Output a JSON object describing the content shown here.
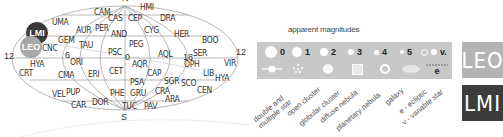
{
  "sky_chart": {
    "pole_label_north": "N",
    "pole_label_south": "S",
    "ra_labels": [
      {
        "text": "12",
        "x": 4,
        "y": 60
      },
      {
        "text": "6",
        "x": 57,
        "y": 56
      },
      {
        "text": "0",
        "x": 123,
        "y": 56
      },
      {
        "text": "18",
        "x": 184,
        "y": 56
      },
      {
        "text": "12",
        "x": 237,
        "y": 52
      }
    ],
    "highlight": {
      "lmi": {
        "label": "LMI",
        "color": "#3a3a3a"
      },
      "leo": {
        "label": "LEO",
        "color": "#a8a8a8"
      }
    },
    "constellations": [
      {
        "abbr": "CAM",
        "x": 94,
        "y": 8
      },
      {
        "abbr": "HMI",
        "x": 140,
        "y": 3
      },
      {
        "abbr": "UMA",
        "x": 52,
        "y": 18
      },
      {
        "abbr": "CAS",
        "x": 108,
        "y": 14
      },
      {
        "abbr": "CEP",
        "x": 128,
        "y": 14
      },
      {
        "abbr": "DRA",
        "x": 160,
        "y": 14
      },
      {
        "abbr": "AUR",
        "x": 76,
        "y": 26
      },
      {
        "abbr": "PER",
        "x": 95,
        "y": 24
      },
      {
        "abbr": "CYG",
        "x": 144,
        "y": 26
      },
      {
        "abbr": "AND",
        "x": 111,
        "y": 30
      },
      {
        "abbr": "HER",
        "x": 174,
        "y": 30
      },
      {
        "abbr": "BOO",
        "x": 202,
        "y": 36
      },
      {
        "abbr": "GEM",
        "x": 58,
        "y": 36
      },
      {
        "abbr": "TAU",
        "x": 79,
        "y": 41
      },
      {
        "abbr": "PEG",
        "x": 129,
        "y": 40
      },
      {
        "abbr": "CNC",
        "x": 42,
        "y": 44
      },
      {
        "abbr": "PSC",
        "x": 108,
        "y": 48
      },
      {
        "abbr": "AQL",
        "x": 158,
        "y": 50
      },
      {
        "abbr": "SER",
        "x": 193,
        "y": 49
      },
      {
        "abbr": "ORI",
        "x": 70,
        "y": 58
      },
      {
        "abbr": "AQR",
        "x": 132,
        "y": 60
      },
      {
        "abbr": "OPH",
        "x": 184,
        "y": 60
      },
      {
        "abbr": "VIR",
        "x": 224,
        "y": 59
      },
      {
        "abbr": "HYA",
        "x": 30,
        "y": 60
      },
      {
        "abbr": "CRT",
        "x": 19,
        "y": 69
      },
      {
        "abbr": "CMA",
        "x": 58,
        "y": 71
      },
      {
        "abbr": "ERI",
        "x": 88,
        "y": 70
      },
      {
        "abbr": "CET",
        "x": 109,
        "y": 67
      },
      {
        "abbr": "CAP",
        "x": 147,
        "y": 69
      },
      {
        "abbr": "LIB",
        "x": 203,
        "y": 69
      },
      {
        "abbr": "HYA",
        "x": 215,
        "y": 74
      },
      {
        "abbr": "PSA",
        "x": 130,
        "y": 78
      },
      {
        "abbr": "SGR",
        "x": 164,
        "y": 77
      },
      {
        "abbr": "SCO",
        "x": 181,
        "y": 79
      },
      {
        "abbr": "CEN",
        "x": 197,
        "y": 86
      },
      {
        "abbr": "PUP",
        "x": 66,
        "y": 88
      },
      {
        "abbr": "VEL",
        "x": 52,
        "y": 90
      },
      {
        "abbr": "PHE",
        "x": 110,
        "y": 89
      },
      {
        "abbr": "GRU",
        "x": 130,
        "y": 89
      },
      {
        "abbr": "CRA",
        "x": 155,
        "y": 87
      },
      {
        "abbr": "ARA",
        "x": 165,
        "y": 95
      },
      {
        "abbr": "CAR",
        "x": 71,
        "y": 101
      },
      {
        "abbr": "DOR",
        "x": 92,
        "y": 98
      },
      {
        "abbr": "TUC",
        "x": 122,
        "y": 102
      },
      {
        "abbr": "PAV",
        "x": 144,
        "y": 102
      }
    ]
  },
  "legend": {
    "title": "apparent magnitudes",
    "background": "#c8c8c8",
    "magnitudes": [
      {
        "label": "0",
        "size": 12
      },
      {
        "label": "1",
        "size": 10
      },
      {
        "label": "2",
        "size": 8
      },
      {
        "label": "3",
        "size": 6
      },
      {
        "label": "4",
        "size": 5
      },
      {
        "label": "5",
        "size": 4
      }
    ],
    "variable_label": "v.",
    "ecliptic_label": "e",
    "object_types": [
      "double and multiple star",
      "open cluster",
      "globular cluster",
      "diffuse nebula",
      "planetary nebula",
      "galaxy",
      "e - ecliptic",
      "v - variable star"
    ]
  },
  "tags": [
    {
      "label": "LEO",
      "color": "#b4b4b4"
    },
    {
      "label": "LMI",
      "color": "#3c3c3c"
    }
  ]
}
